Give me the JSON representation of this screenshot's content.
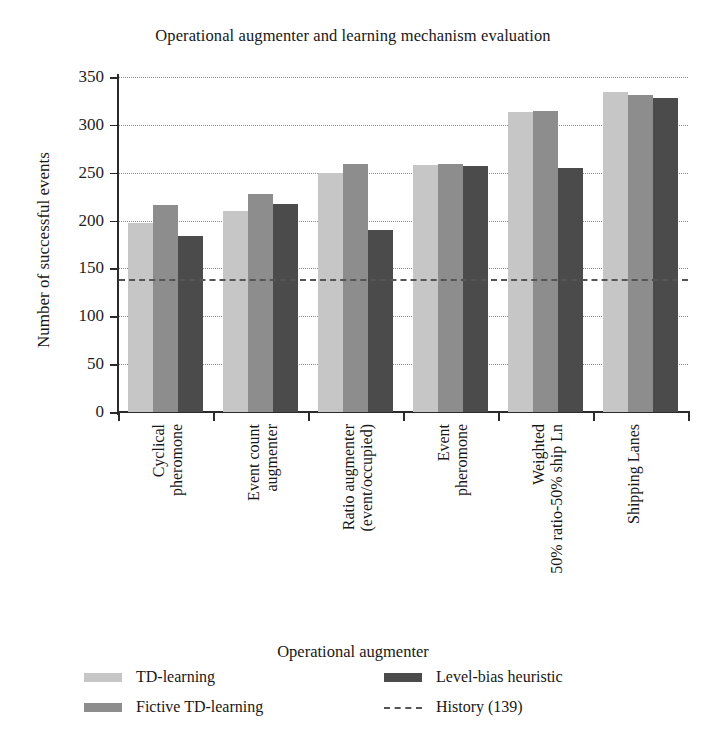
{
  "chart_data": {
    "type": "bar",
    "title": "Operational augmenter and learning mechanism evaluation",
    "xlabel": "Operational augmenter",
    "ylabel": "Number of successful events",
    "ylim": [
      0,
      350
    ],
    "yticks": [
      0,
      50,
      100,
      150,
      200,
      250,
      300,
      350
    ],
    "grid": "dotted-horizontal",
    "legend_position": "bottom",
    "categories": [
      "Cyclical\npheromone",
      "Event count\naugmenter",
      "Ratio augmenter\n(event/occupied)",
      "Event\npheromone",
      "Weighted\n50% ratio-50% ship Ln",
      "Shipping Lanes"
    ],
    "series": [
      {
        "name": "TD-learning",
        "color": "#c6c6c6",
        "values": [
          197,
          210,
          250,
          258,
          313,
          334
        ]
      },
      {
        "name": "Fictive TD-learning",
        "color": "#8d8d8d",
        "values": [
          216,
          228,
          259,
          259,
          315,
          331
        ]
      },
      {
        "name": "Level-bias heuristic",
        "color": "#4b4b4b",
        "values": [
          184,
          217,
          190,
          257,
          255,
          328
        ]
      }
    ],
    "annotations": [
      {
        "type": "hline",
        "label": "History (139)",
        "value": 139,
        "style": "dashed",
        "color": "#555555"
      }
    ]
  },
  "legend": {
    "entries": [
      {
        "label": "TD-learning",
        "swatch": "s0"
      },
      {
        "label": "Fictive TD-learning",
        "swatch": "s1"
      },
      {
        "label": "Level-bias heuristic",
        "swatch": "s2"
      },
      {
        "label": "History (139)",
        "swatch": "dash"
      }
    ]
  }
}
